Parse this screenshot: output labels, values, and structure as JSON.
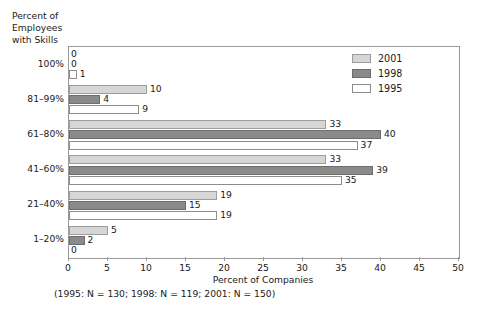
{
  "chart_data": {
    "type": "bar",
    "orientation": "horizontal",
    "title": "",
    "xlabel": "Percent of Companies",
    "ylabel": "Percent of\nEmployees\nwith Skills",
    "categories": [
      "100%",
      "81–99%",
      "61–80%",
      "41–60%",
      "21–40%",
      "1–20%"
    ],
    "series": [
      {
        "name": "2001",
        "color": "#d6d6d6",
        "values": [
          0,
          10,
          33,
          33,
          19,
          5
        ]
      },
      {
        "name": "1998",
        "color": "#8a8a8a",
        "values": [
          0,
          4,
          40,
          39,
          15,
          2
        ]
      },
      {
        "name": "1995",
        "color": "#ffffff",
        "values": [
          1,
          9,
          37,
          35,
          19,
          0
        ]
      }
    ],
    "xlim": [
      0,
      50
    ],
    "xticks": [
      0,
      5,
      10,
      15,
      20,
      25,
      30,
      35,
      40,
      45,
      50
    ],
    "xtick_labels": [
      "0",
      "5",
      "10",
      "15",
      "20",
      "25",
      "30",
      "35",
      "40",
      "45",
      "50"
    ],
    "grid": false,
    "legend_position": "top-right",
    "data_labels": true
  },
  "legend": {
    "entries": [
      {
        "label": "2001"
      },
      {
        "label": "1998"
      },
      {
        "label": "1995"
      }
    ]
  },
  "caption": "(1995: N = 130; 1998: N = 119; 2001: N = 150)"
}
